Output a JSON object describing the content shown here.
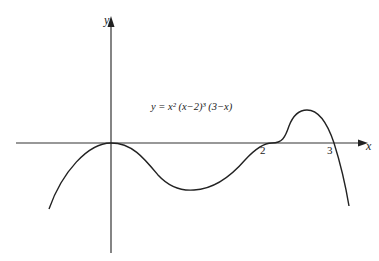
{
  "figure": {
    "equation": "y = x² (x−2)³ (3−x)",
    "axis_labels": {
      "x": "x",
      "y": "y"
    },
    "tick_labels": [
      "2",
      "3"
    ],
    "roots": [
      0,
      2,
      3
    ]
  }
}
